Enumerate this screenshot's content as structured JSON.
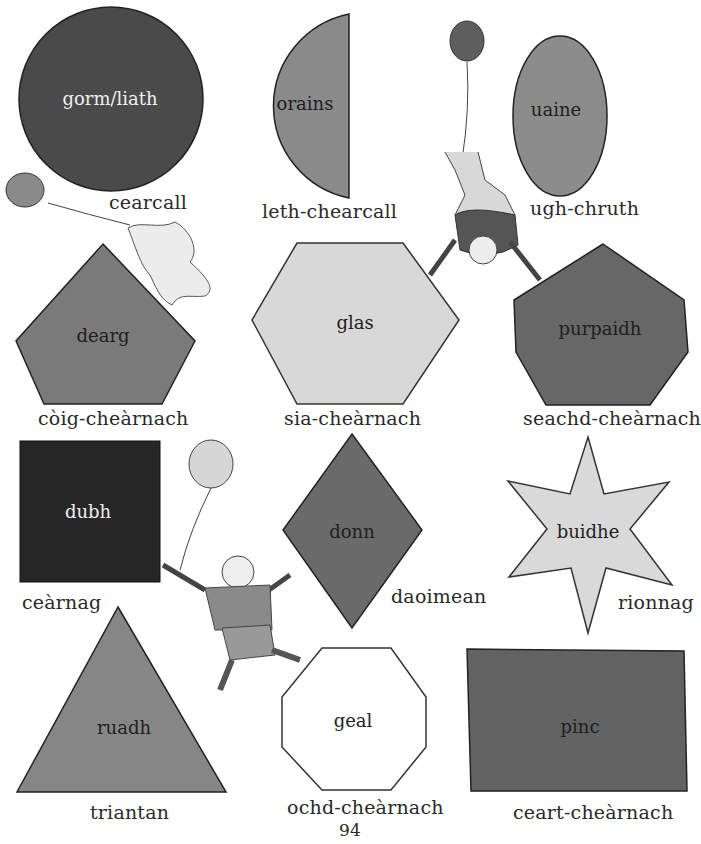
{
  "page_number": "94",
  "shapes": [
    {
      "id": "circle",
      "name": "cearcall",
      "color_word": "gorm/liath",
      "fill": "#4a4a4a"
    },
    {
      "id": "semicircle",
      "name": "leth-chearcall",
      "color_word": "orains",
      "fill": "#8a8a8a"
    },
    {
      "id": "oval",
      "name": "ugh-chruth",
      "color_word": "uaine",
      "fill": "#8c8c8c"
    },
    {
      "id": "pentagon",
      "name": "còig-cheàrnach",
      "color_word": "dearg",
      "fill": "#7a7a7a"
    },
    {
      "id": "hexagon",
      "name": "sia-cheàrnach",
      "color_word": "glas",
      "fill": "#d8d8d8"
    },
    {
      "id": "heptagon",
      "name": "seachd-cheàrnach",
      "color_word": "purpaidh",
      "fill": "#676767"
    },
    {
      "id": "square",
      "name": "ceàrnag",
      "color_word": "dubh",
      "fill": "#262626"
    },
    {
      "id": "diamond",
      "name": "daoimean",
      "color_word": "donn",
      "fill": "#6a6a6a"
    },
    {
      "id": "star",
      "name": "rionnag",
      "color_word": "buidhe",
      "fill": "#d9d9d9"
    },
    {
      "id": "triangle",
      "name": "triantan",
      "color_word": "ruadh",
      "fill": "#868686"
    },
    {
      "id": "octagon",
      "name": "ochd-cheàrnach",
      "color_word": "geal",
      "fill": "#ffffff"
    },
    {
      "id": "rectangle",
      "name": "ceart-cheàrnach",
      "color_word": "pinc",
      "fill": "#626262"
    }
  ],
  "illustrations": {
    "balloon_1_number": "1",
    "balloon_2_number": "10",
    "balloon_4_number": "4"
  }
}
